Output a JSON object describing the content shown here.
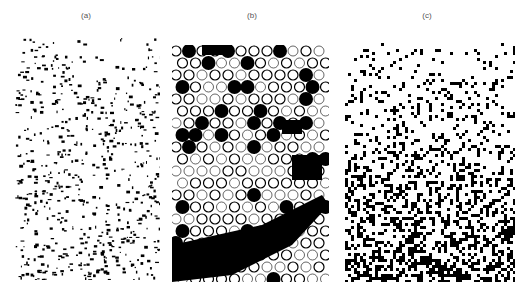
{
  "figure": {
    "panels": [
      {
        "label": "(a)",
        "texture": "sparse-speckle",
        "x": 15,
        "y": 38,
        "w": 145,
        "h": 242
      },
      {
        "label": "(b)",
        "texture": "hexagonal-cells",
        "x": 172,
        "y": 45,
        "w": 157,
        "h": 237
      },
      {
        "label": "(c)",
        "texture": "dense-blocky-noise",
        "x": 345,
        "y": 40,
        "w": 170,
        "h": 242
      }
    ],
    "colors": {
      "ink": "#000000",
      "paper": "#ffffff",
      "label": "#555555"
    }
  }
}
